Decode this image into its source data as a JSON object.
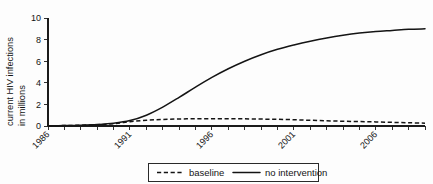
{
  "chart_data": {
    "type": "line",
    "title": "",
    "xlabel": "",
    "ylabel_line1": "current HIV infections",
    "ylabel_line2": "in millions",
    "grid": false,
    "legend_position": "bottom-center",
    "xlim": [
      1986,
      2009
    ],
    "ylim": [
      0,
      10
    ],
    "yticks": [
      0,
      2,
      4,
      6,
      8,
      10
    ],
    "ytick_labels": [
      "0",
      "2",
      "4",
      "6",
      "8",
      "10"
    ],
    "xticks": [
      1986,
      1987,
      1988,
      1989,
      1990,
      1991,
      1992,
      1993,
      1994,
      1995,
      1996,
      1997,
      1998,
      1999,
      2000,
      2001,
      2002,
      2003,
      2004,
      2005,
      2006,
      2007,
      2008,
      2009
    ],
    "xtick_labels_major": [
      "1986",
      "1991",
      "1996",
      "2001",
      "2006"
    ],
    "xtick_label_years": [
      1986,
      1991,
      1996,
      2001,
      2006
    ],
    "xtick_label_rotation_deg": -45,
    "x": [
      1986,
      1987,
      1988,
      1989,
      1990,
      1991,
      1992,
      1993,
      1994,
      1995,
      1996,
      1997,
      1998,
      1999,
      2000,
      2001,
      2002,
      2003,
      2004,
      2005,
      2006,
      2007,
      2008,
      2009
    ],
    "series": [
      {
        "name": "baseline",
        "style": "dashed",
        "color": "#141414",
        "values": [
          0.02,
          0.04,
          0.07,
          0.12,
          0.22,
          0.4,
          0.53,
          0.6,
          0.65,
          0.67,
          0.68,
          0.68,
          0.66,
          0.64,
          0.62,
          0.58,
          0.53,
          0.48,
          0.44,
          0.41,
          0.38,
          0.34,
          0.3,
          0.26
        ]
      },
      {
        "name": "no intervention",
        "style": "solid",
        "color": "#141414",
        "values": [
          0.02,
          0.04,
          0.07,
          0.13,
          0.25,
          0.5,
          1.0,
          1.75,
          2.65,
          3.6,
          4.5,
          5.3,
          6.0,
          6.6,
          7.1,
          7.5,
          7.85,
          8.15,
          8.4,
          8.6,
          8.75,
          8.85,
          8.95,
          9.0
        ]
      }
    ],
    "legend": [
      {
        "label": "baseline",
        "style": "dashed"
      },
      {
        "label": "no intervention",
        "style": "solid"
      }
    ]
  }
}
